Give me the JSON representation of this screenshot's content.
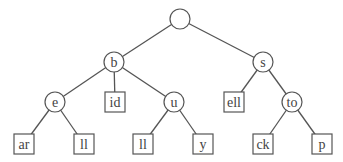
{
  "diagram": {
    "type": "trie",
    "style": {
      "stroke_color": "#555555",
      "text_color": "#444444",
      "background": "#ffffff"
    },
    "nodes": [
      {
        "id": "root",
        "label": "",
        "shape": "circle",
        "x": 180,
        "y": 19
      },
      {
        "id": "b",
        "label": "b",
        "shape": "circle",
        "x": 114,
        "y": 62
      },
      {
        "id": "s",
        "label": "s",
        "shape": "circle",
        "x": 263,
        "y": 62
      },
      {
        "id": "e",
        "label": "e",
        "shape": "circle",
        "x": 55,
        "y": 102
      },
      {
        "id": "id",
        "label": "id",
        "shape": "box",
        "x": 115,
        "y": 102
      },
      {
        "id": "u",
        "label": "u",
        "shape": "circle",
        "x": 174,
        "y": 102
      },
      {
        "id": "ell",
        "label": "ell",
        "shape": "box",
        "x": 234,
        "y": 102
      },
      {
        "id": "to",
        "label": "to",
        "shape": "circle",
        "x": 292,
        "y": 102
      },
      {
        "id": "ar",
        "label": "ar",
        "shape": "box",
        "x": 24,
        "y": 144
      },
      {
        "id": "ll1",
        "label": "ll",
        "shape": "box",
        "x": 84,
        "y": 144
      },
      {
        "id": "ll2",
        "label": "ll",
        "shape": "box",
        "x": 143,
        "y": 144
      },
      {
        "id": "y",
        "label": "y",
        "shape": "box",
        "x": 203,
        "y": 144
      },
      {
        "id": "ck",
        "label": "ck",
        "shape": "box",
        "x": 263,
        "y": 144
      },
      {
        "id": "p",
        "label": "p",
        "shape": "box",
        "x": 322,
        "y": 144
      }
    ],
    "edges": [
      {
        "from": "root",
        "to": "b"
      },
      {
        "from": "root",
        "to": "s"
      },
      {
        "from": "b",
        "to": "e"
      },
      {
        "from": "b",
        "to": "id"
      },
      {
        "from": "b",
        "to": "u"
      },
      {
        "from": "s",
        "to": "ell"
      },
      {
        "from": "s",
        "to": "to"
      },
      {
        "from": "e",
        "to": "ar"
      },
      {
        "from": "e",
        "to": "ll1"
      },
      {
        "from": "u",
        "to": "ll2"
      },
      {
        "from": "u",
        "to": "y"
      },
      {
        "from": "to",
        "to": "ck"
      },
      {
        "from": "to",
        "to": "p"
      }
    ]
  }
}
